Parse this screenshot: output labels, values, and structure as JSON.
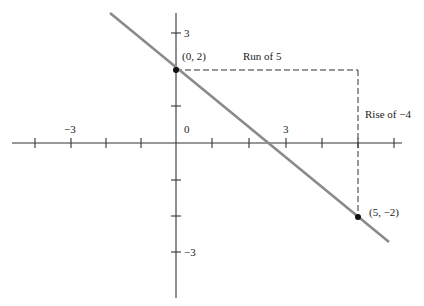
{
  "figure": {
    "axes": {
      "x_tick_labels": [
        {
          "value": -3,
          "label": "−3"
        },
        {
          "value": 0,
          "label": "0"
        },
        {
          "value": 3,
          "label": "3"
        }
      ],
      "y_tick_labels": [
        {
          "value": 3,
          "label": "3"
        },
        {
          "value": -3,
          "label": "−3"
        }
      ],
      "x_range": [
        -4.5,
        6.3
      ],
      "y_range": [
        -4.3,
        3.6
      ]
    },
    "points": [
      {
        "x": 0,
        "y": 2,
        "label": "(0, 2)"
      },
      {
        "x": 5,
        "y": -2,
        "label": "(5, −2)"
      }
    ],
    "annotations": {
      "run": "Run of 5",
      "rise": "Rise of −4"
    },
    "line": {
      "slope": -0.8,
      "intercept": 2,
      "color": "#8a8a8a"
    }
  }
}
